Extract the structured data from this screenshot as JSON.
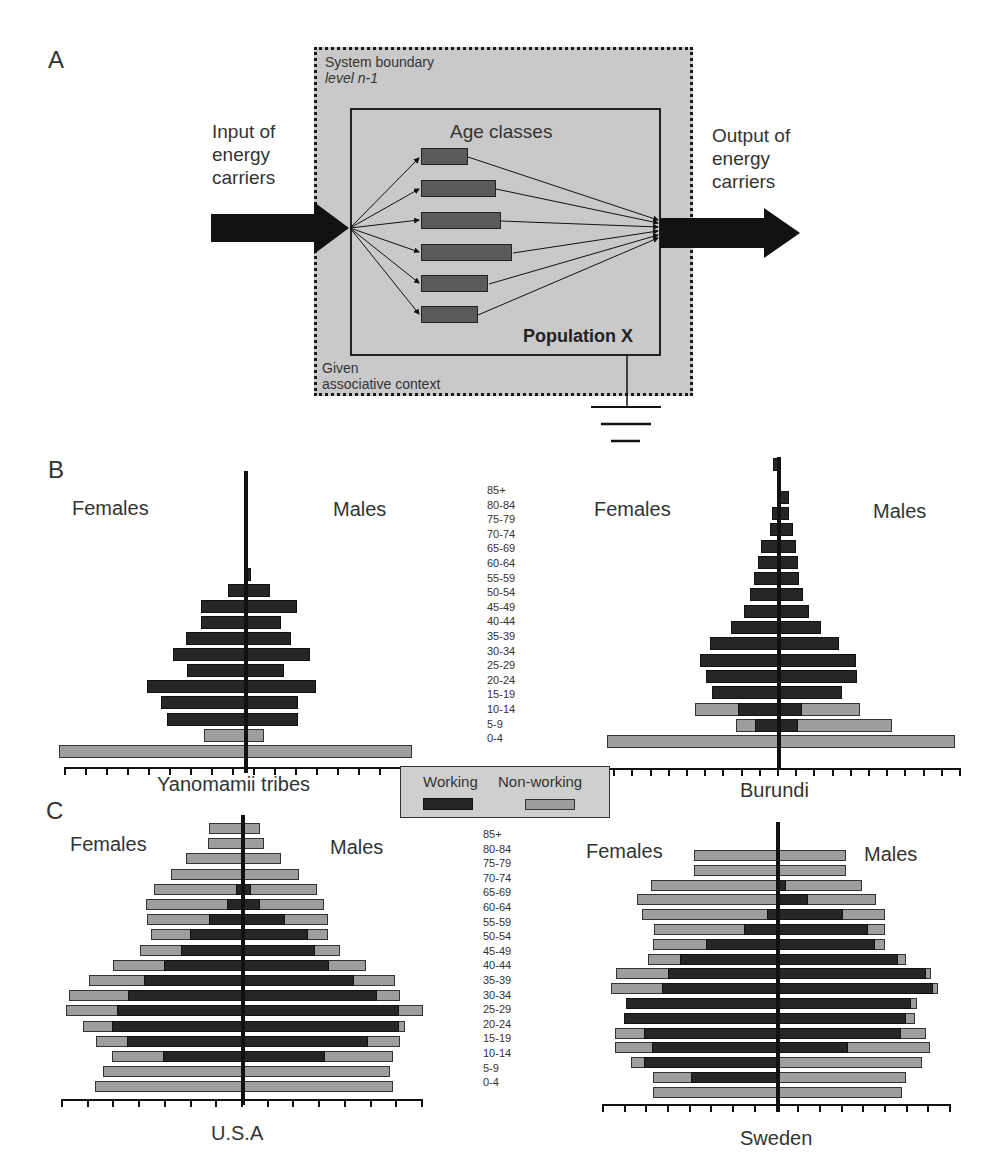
{
  "panels": {
    "a": {
      "letter": "A",
      "system_boundary": "System boundary",
      "level": "level n-1",
      "context_line1": "Given",
      "context_line2": "associative context",
      "input_label": [
        "Input of",
        "energy",
        "carriers"
      ],
      "output_label": [
        "Output of",
        "energy",
        "carriers"
      ],
      "age_classes_title": "Age classes",
      "population_label": "Population X",
      "age_class_bar_widths": [
        47,
        75,
        80,
        91,
        67,
        57
      ]
    },
    "b": {
      "letter": "B"
    },
    "c": {
      "letter": "C"
    }
  },
  "labels": {
    "females": "Females",
    "males": "Males"
  },
  "age_groups": [
    "85+",
    "80-84",
    "75-79",
    "70-74",
    "65-69",
    "60-64",
    "55-59",
    "50-54",
    "45-49",
    "40-44",
    "35-39",
    "30-34",
    "25-29",
    "20-24",
    "15-19",
    "10-14",
    "5-9",
    "0-4"
  ],
  "legend": {
    "working": "Working",
    "non_working": "Non-working",
    "working_color": "#262626",
    "non_working_color": "#9e9e9e"
  },
  "chart_data": [
    {
      "type": "bar",
      "title": "Yanomamii tribes",
      "orientation": "population-pyramid",
      "categories": [
        "85+",
        "80-84",
        "75-79",
        "70-74",
        "65-69",
        "60-64",
        "55-59",
        "50-54",
        "45-49",
        "40-44",
        "35-39",
        "30-34",
        "25-29",
        "20-24",
        "15-19",
        "10-14",
        "5-9",
        "0-4"
      ],
      "units": "relative bar length (px from center axis)",
      "series": [
        {
          "name": "Females working",
          "values": [
            0,
            0,
            0,
            0,
            0,
            0,
            0,
            18,
            45,
            45,
            60,
            73,
            59,
            99,
            85,
            79,
            0,
            0
          ]
        },
        {
          "name": "Females non-working",
          "values": [
            0,
            0,
            0,
            0,
            0,
            0,
            0,
            0,
            0,
            0,
            0,
            0,
            0,
            0,
            0,
            6,
            42,
            187
          ]
        },
        {
          "name": "Males working",
          "values": [
            0,
            0,
            0,
            0,
            0,
            0,
            5,
            24,
            51,
            35,
            45,
            64,
            38,
            70,
            52,
            52,
            0,
            0
          ]
        },
        {
          "name": "Males non-working",
          "values": [
            0,
            0,
            0,
            0,
            0,
            0,
            0,
            0,
            0,
            0,
            0,
            0,
            0,
            0,
            0,
            0,
            18,
            166
          ]
        }
      ]
    },
    {
      "type": "bar",
      "title": "Burundi",
      "orientation": "population-pyramid",
      "categories": [
        "85+",
        "80-84",
        "75-79",
        "70-74",
        "65-69",
        "60-64",
        "55-59",
        "50-54",
        "45-49",
        "40-44",
        "35-39",
        "30-34",
        "25-29",
        "20-24",
        "15-19",
        "10-14",
        "5-9",
        "0-4"
      ],
      "units": "relative bar length (px from center axis)",
      "series": [
        {
          "name": "Females working",
          "values": [
            6,
            0,
            0,
            7,
            9,
            18,
            21,
            25,
            29,
            35,
            48,
            69,
            79,
            73,
            67,
            41,
            24,
            0
          ]
        },
        {
          "name": "Females non-working",
          "values": [
            0,
            0,
            0,
            0,
            0,
            0,
            0,
            0,
            0,
            0,
            0,
            4,
            12,
            27,
            61,
            84,
            43,
            172
          ]
        },
        {
          "name": "Males working",
          "values": [
            0,
            0,
            10,
            10,
            14,
            17,
            19,
            20,
            24,
            30,
            42,
            60,
            77,
            78,
            63,
            23,
            19,
            0
          ]
        },
        {
          "name": "Males non-working",
          "values": [
            0,
            0,
            0,
            0,
            0,
            0,
            0,
            0,
            0,
            0,
            3,
            3,
            0,
            9,
            29,
            81,
            113,
            176
          ]
        }
      ]
    },
    {
      "type": "bar",
      "title": "U.S.A",
      "orientation": "population-pyramid",
      "categories": [
        "85+",
        "80-84",
        "75-79",
        "70-74",
        "65-69",
        "60-64",
        "55-59",
        "50-54",
        "45-49",
        "40-44",
        "35-39",
        "30-34",
        "25-29",
        "20-24",
        "15-19",
        "10-14",
        "5-9",
        "0-4"
      ],
      "units": "relative bar length (px from center axis)",
      "series": [
        {
          "name": "Females working",
          "values": [
            0,
            0,
            0,
            0,
            7,
            16,
            34,
            53,
            62,
            79,
            99,
            115,
            126,
            131,
            116,
            80,
            0,
            0
          ]
        },
        {
          "name": "Females non-working",
          "values": [
            34,
            35,
            57,
            72,
            89,
            97,
            96,
            92,
            103,
            130,
            154,
            174,
            177,
            160,
            147,
            131,
            140,
            148
          ]
        },
        {
          "name": "Males working",
          "values": [
            0,
            0,
            0,
            0,
            8,
            17,
            42,
            65,
            72,
            86,
            111,
            134,
            156,
            156,
            125,
            82,
            0,
            0
          ]
        },
        {
          "name": "Males non-working",
          "values": [
            17,
            21,
            38,
            56,
            74,
            81,
            85,
            85,
            97,
            123,
            152,
            157,
            180,
            162,
            157,
            150,
            147,
            150
          ]
        }
      ]
    },
    {
      "type": "bar",
      "title": "Sweden",
      "orientation": "population-pyramid",
      "categories": [
        "85+",
        "80-84",
        "75-79",
        "70-74",
        "65-69",
        "60-64",
        "55-59",
        "50-54",
        "45-49",
        "40-44",
        "35-39",
        "30-34",
        "25-29",
        "20-24",
        "15-19",
        "10-14",
        "5-9",
        "0-4"
      ],
      "units": "relative bar length (px from center axis)",
      "series": [
        {
          "name": "Females working",
          "values": [
            0,
            0,
            0,
            0,
            11,
            34,
            72,
            98,
            110,
            116,
            152,
            154,
            134,
            126,
            134,
            87,
            0,
            0,
            0
          ]
        },
        {
          "name": "Females non-working",
          "values": [
            84,
            84,
            127,
            141,
            136,
            124,
            125,
            130,
            162,
            167,
            149,
            141,
            163,
            163,
            147,
            125,
            125
          ]
        },
        {
          "name": "Males working",
          "values": [
            0,
            0,
            8,
            30,
            65,
            90,
            97,
            120,
            148,
            155,
            133,
            128,
            123,
            70,
            0,
            0,
            0
          ]
        },
        {
          "name": "Males non-working",
          "values": [
            68,
            68,
            84,
            98,
            107,
            107,
            107,
            128,
            153,
            160,
            139,
            137,
            148,
            152,
            144,
            128,
            124
          ]
        }
      ]
    }
  ],
  "charts": {
    "yanomamii": {
      "title": "Yanomamii tribes"
    },
    "burundi": {
      "title": "Burundi"
    },
    "usa": {
      "title": "U.S.A"
    },
    "sweden": {
      "title": "Sweden"
    }
  }
}
